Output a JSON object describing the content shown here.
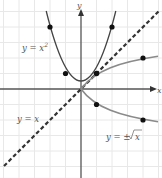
{
  "diagram": {
    "axes": {
      "x_label": "x",
      "y_label": "y",
      "origin_px": [
        81,
        89
      ],
      "unit_px": 15.5,
      "x_range": [
        -5.2,
        5.2
      ],
      "y_range": [
        -5.7,
        5.7
      ]
    },
    "curves": [
      {
        "name": "parabola",
        "label": "y = x",
        "label_sup": "2",
        "style": "solid",
        "color": "#555555",
        "points": [
          [
            -2,
            4
          ],
          [
            -1,
            1
          ],
          [
            1,
            1
          ],
          [
            2,
            4
          ]
        ]
      },
      {
        "name": "sqrt",
        "label": "y = ±√x",
        "style": "solid",
        "color": "#888888",
        "points": [
          [
            1,
            1
          ],
          [
            4,
            2
          ],
          [
            1,
            -1
          ],
          [
            4,
            -2
          ]
        ]
      },
      {
        "name": "identity",
        "label": "y = x",
        "style": "dashed",
        "color": "#333333"
      }
    ],
    "labels": {
      "parabola_a": "y = x",
      "parabola_sup": "2",
      "identity": "y = x",
      "sqrt_prefix": "y = ±",
      "sqrt_arg": "x",
      "x_axis": "x",
      "y_axis": "y"
    },
    "colors": {
      "grid": "#e6e6e6",
      "axis": "#555555",
      "parabola": "#444444",
      "sqrt": "#8a8a8a",
      "dashed": "#333333",
      "point": "#111111"
    }
  }
}
